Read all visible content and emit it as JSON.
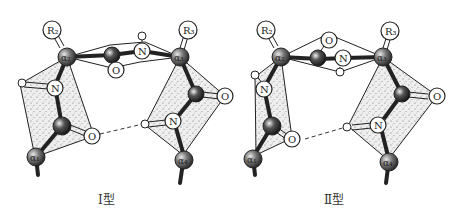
{
  "figure": {
    "panels": [
      {
        "id": "type-I",
        "caption": "Ⅰ型",
        "atoms": {
          "R2": "R₂",
          "R3": "R₃",
          "a1": "α₁",
          "a2": "α₂",
          "a3": "α₃",
          "a4": "α₄",
          "N_left": "N",
          "O_left": "O",
          "O_top": "O",
          "N_top": "N",
          "O_right": "O",
          "N_right": "N"
        }
      },
      {
        "id": "type-II",
        "caption": "Ⅱ型",
        "atoms": {
          "R2": "R₂",
          "R3": "R₃",
          "a1": "α₁",
          "a2": "α₂",
          "a3": "α₃",
          "a4": "α₄",
          "N_left": "N",
          "O_left": "O",
          "O_top": "O",
          "N_top": "N",
          "O_right": "O",
          "N_right": "N"
        }
      }
    ],
    "hbond_style": "dashed",
    "colors": {
      "plane_fill": "#d8d8d8",
      "atom_dark": "#555555",
      "atom_light": "#ffffff",
      "bond": "#222222"
    }
  }
}
